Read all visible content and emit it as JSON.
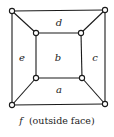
{
  "diagram": {
    "type": "planar-graph",
    "vertices": [
      {
        "id": "o_tl",
        "x": 12,
        "y": 11
      },
      {
        "id": "o_tr",
        "x": 105,
        "y": 10
      },
      {
        "id": "o_br",
        "x": 105,
        "y": 104
      },
      {
        "id": "o_bl",
        "x": 12,
        "y": 105
      },
      {
        "id": "i_tl",
        "x": 36,
        "y": 33
      },
      {
        "id": "i_tr",
        "x": 81,
        "y": 33
      },
      {
        "id": "i_br",
        "x": 82,
        "y": 78
      },
      {
        "id": "i_bl",
        "x": 36,
        "y": 78
      }
    ],
    "edges": [
      [
        "o_tl",
        "o_tr"
      ],
      [
        "o_tr",
        "o_br"
      ],
      [
        "o_br",
        "o_bl"
      ],
      [
        "o_bl",
        "o_tl"
      ],
      [
        "i_tl",
        "i_tr"
      ],
      [
        "i_tr",
        "i_br"
      ],
      [
        "i_br",
        "i_bl"
      ],
      [
        "i_bl",
        "i_tl"
      ],
      [
        "o_tl",
        "i_tl"
      ],
      [
        "o_tr",
        "i_tr"
      ],
      [
        "o_br",
        "i_br"
      ],
      [
        "o_bl",
        "i_bl"
      ]
    ],
    "faces": [
      {
        "label": "d",
        "x": 59,
        "y": 26
      },
      {
        "label": "e",
        "x": 22,
        "y": 61
      },
      {
        "label": "b",
        "x": 58,
        "y": 61
      },
      {
        "label": "c",
        "x": 95,
        "y": 61
      },
      {
        "label": "a",
        "x": 59,
        "y": 93
      }
    ],
    "caption": {
      "face_label": "f",
      "text": "(outside face)"
    }
  }
}
